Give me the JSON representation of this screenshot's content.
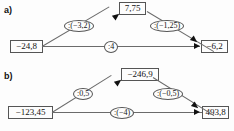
{
  "figure": {
    "type": "arrow-diagram-pair",
    "caption_a": "a)",
    "caption_b": "b)"
  },
  "panels": [
    {
      "id": "a",
      "label": "a)",
      "nodes": {
        "start": "−24,8",
        "top": "7,75",
        "end": "−6,2"
      },
      "operators": {
        "up": ":(−3,2)",
        "down": ":(−1,25)",
        "direct": ":4"
      }
    },
    {
      "id": "b",
      "label": "b)",
      "nodes": {
        "start": "−123,45",
        "top": "−246,9",
        "end": "493,8"
      },
      "operators": {
        "up": ":0,5",
        "down": ":(−0,5)",
        "direct": ":(−4)"
      }
    }
  ]
}
